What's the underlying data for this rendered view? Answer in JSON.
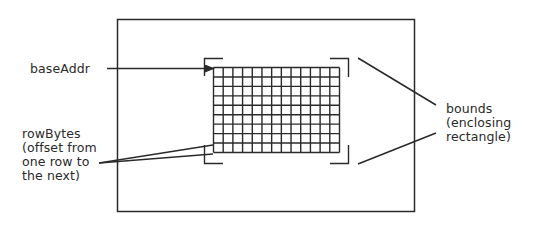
{
  "diagram": {
    "labels": {
      "base_addr": "baseAddr",
      "row_bytes": [
        "rowBytes",
        "(offset from",
        "one row to",
        "the next)"
      ],
      "bounds": [
        "bounds",
        "(enclosing",
        "rectangle)"
      ]
    },
    "grid": {
      "columns": 13,
      "rows": 9
    },
    "colors": {
      "stroke": "#2a2a2a",
      "background": "#ffffff"
    }
  }
}
